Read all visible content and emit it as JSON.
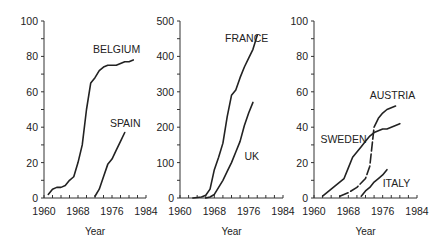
{
  "chart_data": [
    {
      "type": "line",
      "title": "",
      "xlabel": "Year",
      "ylabel": "",
      "xlim": [
        1960,
        1984
      ],
      "ylim": [
        0,
        100
      ],
      "xticks": [
        1960,
        1968,
        1976,
        1984
      ],
      "yticks": [
        0,
        20,
        40,
        60,
        80,
        100
      ],
      "grid": false,
      "series": [
        {
          "name": "BELGIUM",
          "style": "solid",
          "x": [
            1961,
            1962,
            1963,
            1964,
            1965,
            1966,
            1967,
            1968,
            1969,
            1970,
            1971,
            1972,
            1973,
            1974,
            1975,
            1976,
            1977,
            1978,
            1979,
            1980,
            1981
          ],
          "values": [
            2,
            5,
            6,
            6,
            7,
            10,
            12,
            20,
            30,
            50,
            65,
            68,
            72,
            74,
            75,
            75,
            75,
            76,
            77,
            77,
            78
          ]
        },
        {
          "name": "SPAIN",
          "style": "solid",
          "x": [
            1972,
            1973,
            1974,
            1975,
            1976,
            1977,
            1978,
            1979
          ],
          "values": [
            1,
            5,
            12,
            19,
            22,
            27,
            32,
            37
          ]
        }
      ],
      "annotations": [
        {
          "text": "BELGIUM",
          "x": 1971.5,
          "y": 82
        },
        {
          "text": "SPAIN",
          "x": 1975.5,
          "y": 40
        }
      ]
    },
    {
      "type": "line",
      "title": "",
      "xlabel": "Year",
      "ylabel": "",
      "xlim": [
        1960,
        1984
      ],
      "ylim": [
        0,
        500
      ],
      "xticks": [
        1960,
        1968,
        1976,
        1984
      ],
      "yticks": [
        0,
        100,
        200,
        300,
        400,
        500
      ],
      "grid": false,
      "series": [
        {
          "name": "FRANCE",
          "style": "solid",
          "x": [
            1963,
            1965,
            1966,
            1967,
            1968,
            1969,
            1970,
            1971,
            1972,
            1973,
            1974,
            1975,
            1976,
            1977,
            1978
          ],
          "values": [
            0,
            3,
            8,
            25,
            80,
            115,
            155,
            230,
            290,
            305,
            340,
            370,
            395,
            420,
            460
          ]
        },
        {
          "name": "UK",
          "style": "solid",
          "x": [
            1966,
            1967,
            1968,
            1969,
            1970,
            1971,
            1972,
            1973,
            1974,
            1975,
            1976,
            1977
          ],
          "values": [
            0,
            3,
            10,
            30,
            50,
            75,
            100,
            130,
            160,
            205,
            240,
            270
          ]
        }
      ],
      "annotations": [
        {
          "text": "FRANCE",
          "x": 1970.5,
          "y": 440
        },
        {
          "text": "UK",
          "x": 1975,
          "y": 108
        }
      ]
    },
    {
      "type": "line",
      "title": "",
      "xlabel": "Year",
      "ylabel": "",
      "xlim": [
        1960,
        1984
      ],
      "ylim": [
        0,
        100
      ],
      "xticks": [
        1960,
        1968,
        1976,
        1984
      ],
      "yticks": [
        0,
        20,
        40,
        60,
        80,
        100
      ],
      "grid": false,
      "series": [
        {
          "name": "SWEDEN",
          "style": "solid",
          "x": [
            1962,
            1963,
            1964,
            1965,
            1966,
            1967,
            1968,
            1969,
            1970,
            1971,
            1972,
            1973,
            1974,
            1975,
            1976,
            1977,
            1978,
            1979,
            1980
          ],
          "values": [
            1,
            3,
            5,
            7,
            9,
            11,
            17,
            23,
            26,
            29,
            32,
            35,
            37,
            38,
            39,
            39,
            40,
            41,
            42
          ]
        },
        {
          "name": "AUSTRIA",
          "style": "dashed-then-solid",
          "x": [
            1966,
            1968,
            1970,
            1972,
            1973,
            1974,
            1975,
            1976,
            1977,
            1978,
            1979
          ],
          "values": [
            1,
            3,
            6,
            11,
            18,
            40,
            45,
            48,
            50,
            51,
            52
          ]
        },
        {
          "name": "ITALY",
          "style": "solid",
          "x": [
            1971,
            1972,
            1973,
            1974,
            1975,
            1976,
            1977
          ],
          "values": [
            1,
            4,
            6,
            9,
            11,
            13,
            16
          ]
        }
      ],
      "annotations": [
        {
          "text": "AUSTRIA",
          "x": 1973,
          "y": 56
        },
        {
          "text": "SWEDEN",
          "x": 1961.5,
          "y": 31
        },
        {
          "text": "ITALY",
          "x": 1976,
          "y": 6
        }
      ]
    }
  ],
  "panels": [
    {
      "id": "p1",
      "x0": 44,
      "x1": 146,
      "yTop": 21,
      "yBot": 198
    },
    {
      "id": "p2",
      "x0": 180,
      "x1": 283,
      "yTop": 21,
      "yBot": 198
    },
    {
      "id": "p3",
      "x0": 314,
      "x1": 417,
      "yTop": 21,
      "yBot": 198
    }
  ]
}
